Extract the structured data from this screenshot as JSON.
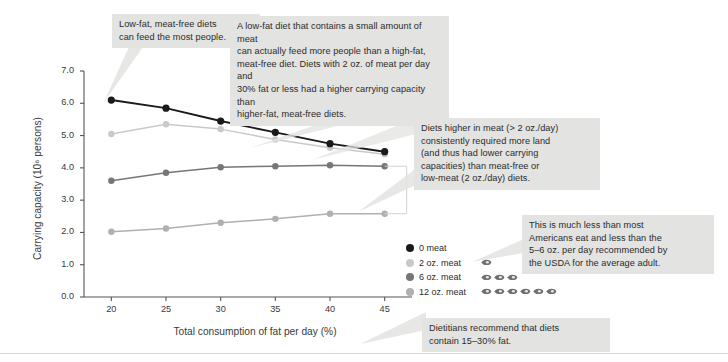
{
  "chart_data": {
    "type": "line",
    "title": "",
    "xlabel": "Total consumption of fat per day (%)",
    "ylabel": "Carrying capacity (10⁶ persons)",
    "x": [
      20,
      25,
      30,
      35,
      40,
      45
    ],
    "xtick_labels": [
      "20",
      "25",
      "30",
      "35",
      "40",
      "45"
    ],
    "ytick_labels": [
      "0.0",
      "1.0",
      "2.0",
      "3.0",
      "4.0",
      "5.0",
      "6.0",
      "7.0"
    ],
    "ytick_values": [
      0.0,
      1.0,
      2.0,
      3.0,
      4.0,
      5.0,
      6.0,
      7.0
    ],
    "xlim": [
      17.5,
      47.5
    ],
    "ylim": [
      0.0,
      7.0
    ],
    "grid": false,
    "legend_position": "inside-lower-right",
    "series": [
      {
        "name": "0 meat",
        "values": [
          6.1,
          5.85,
          5.45,
          5.1,
          4.75,
          4.5
        ],
        "color": "#1a1a1a"
      },
      {
        "name": "2 oz. meat",
        "values": [
          5.05,
          5.35,
          5.2,
          4.88,
          4.62,
          4.42
        ],
        "color": "#c9c9c9"
      },
      {
        "name": "6 oz. meat",
        "values": [
          3.6,
          3.85,
          4.02,
          4.05,
          4.08,
          4.05
        ],
        "color": "#767676"
      },
      {
        "name": "12 oz. meat",
        "values": [
          2.02,
          2.12,
          2.3,
          2.42,
          2.58,
          2.58
        ],
        "color": "#b0b0b0"
      }
    ]
  },
  "legend": {
    "items": [
      {
        "label": "0 meat",
        "color": "#1a1a1a",
        "meat_count": 0
      },
      {
        "label": "2 oz. meat",
        "color": "#c9c9c9",
        "meat_count": 1
      },
      {
        "label": "6 oz. meat",
        "color": "#767676",
        "meat_count": 3
      },
      {
        "label": "12 oz. meat",
        "color": "#b0b0b0",
        "meat_count": 6
      }
    ]
  },
  "callouts": {
    "top_left": "Low-fat, meat-free diets\ncan feed the most people.",
    "top_right": "A low-fat diet that contains a small amount of meat\ncan actually feed more people than a high-fat,\nmeat-free diet. Diets with 2 oz. of meat per day and\n30% fat or less had a higher carrying capacity than\nhigher-fat, meat-free diets.",
    "middle_right": "Diets higher in meat (> 2 oz./day)\nconsistently required more land\n(and thus had lower carrying\ncapacities) than meat-free or\nlow-meat (2 oz./day) diets.",
    "lower_right": "This is much less than most\nAmericans eat and less than the\n5–6 oz. per day recommended by\nthe USDA for the average adult.",
    "bottom": "Dietitians recommend that diets\ncontain 15–30% fat."
  },
  "colors": {
    "callout_bg": "#e3e3e1",
    "pointer": "#e3e3e1",
    "axis": "#555555",
    "text": "#2b2b2b"
  }
}
